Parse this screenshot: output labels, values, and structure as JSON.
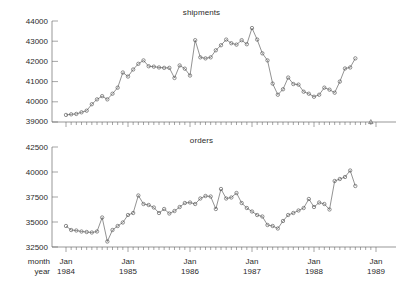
{
  "chart_data": [
    {
      "type": "line",
      "title": "shipments",
      "xlabel": "",
      "ylabel": "",
      "ylim": [
        39000,
        44000
      ],
      "yticks": [
        39000,
        40000,
        41000,
        42000,
        43000,
        44000
      ],
      "ytick_labels": [
        "39000",
        "40000",
        "41000",
        "42000",
        "43000",
        "44000"
      ],
      "xlim": [
        "1984-01",
        "1989-01"
      ],
      "xticks": [
        "1984-01",
        "1985-01",
        "1986-01",
        "1987-01",
        "1988-01",
        "1989-01"
      ],
      "xtick_labels": [
        "Jan 1984",
        "Jan 1985",
        "Jan 1986",
        "Jan 1987",
        "Jan 1988",
        "Jan 1989"
      ],
      "grid": false,
      "legend": "none",
      "marker": "circle",
      "x": [
        "1984-01",
        "1984-02",
        "1984-03",
        "1984-04",
        "1984-05",
        "1984-06",
        "1984-07",
        "1984-08",
        "1984-09",
        "1984-10",
        "1984-11",
        "1984-12",
        "1985-01",
        "1985-02",
        "1985-03",
        "1985-04",
        "1985-05",
        "1985-06",
        "1985-07",
        "1985-08",
        "1985-09",
        "1985-10",
        "1985-11",
        "1985-12",
        "1986-01",
        "1986-02",
        "1986-03",
        "1986-04",
        "1986-05",
        "1986-06",
        "1986-07",
        "1986-08",
        "1986-09",
        "1986-10",
        "1986-11",
        "1986-12",
        "1987-01",
        "1987-02",
        "1987-03",
        "1987-04",
        "1987-05",
        "1987-06",
        "1987-07",
        "1987-08",
        "1987-09",
        "1987-10",
        "1987-11",
        "1987-12",
        "1988-01",
        "1988-02",
        "1988-03",
        "1988-04",
        "1988-05",
        "1988-06",
        "1988-07",
        "1988-08",
        "1988-09"
      ],
      "values": [
        39350,
        39380,
        39400,
        39480,
        39560,
        39880,
        40120,
        40280,
        40120,
        40400,
        40700,
        41450,
        41250,
        41600,
        41880,
        42050,
        41760,
        41740,
        41700,
        41680,
        41680,
        41180,
        41800,
        41640,
        41300,
        43050,
        42200,
        42150,
        42200,
        42550,
        42800,
        43080,
        42900,
        42830,
        43050,
        42850,
        43650,
        43080,
        42400,
        42050,
        40900,
        40350,
        40620,
        41200,
        40880,
        40850,
        40500,
        40400,
        40250,
        40350,
        40700,
        40600,
        40450,
        41000,
        41650,
        41700,
        42150
      ],
      "extra_points": [
        {
          "x": "1988-12",
          "value": 39000,
          "marker": "triangle",
          "note": "lone triangle marker on baseline near Jan 1989"
        }
      ]
    },
    {
      "type": "line",
      "title": "orders",
      "xlabel": "",
      "ylabel": "",
      "ylim": [
        32500,
        42500
      ],
      "yticks": [
        32500,
        35000,
        37500,
        40000,
        42500
      ],
      "ytick_labels": [
        "32500",
        "35000",
        "37500",
        "40000",
        "42500"
      ],
      "xlim": [
        "1984-01",
        "1989-01"
      ],
      "xticks": [
        "1984-01",
        "1985-01",
        "1986-01",
        "1987-01",
        "1988-01",
        "1989-01"
      ],
      "xtick_labels": [
        "Jan 1984",
        "Jan 1985",
        "Jan 1986",
        "Jan 1987",
        "Jan 1988",
        "Jan 1989"
      ],
      "grid": false,
      "legend": "none",
      "marker": "circle",
      "x": [
        "1984-01",
        "1984-02",
        "1984-03",
        "1984-04",
        "1984-05",
        "1984-06",
        "1984-07",
        "1984-08",
        "1984-09",
        "1984-10",
        "1984-11",
        "1984-12",
        "1985-01",
        "1985-02",
        "1985-03",
        "1985-04",
        "1985-05",
        "1985-06",
        "1985-07",
        "1985-08",
        "1985-09",
        "1985-10",
        "1985-11",
        "1985-12",
        "1986-01",
        "1986-02",
        "1986-03",
        "1986-04",
        "1986-05",
        "1986-06",
        "1986-07",
        "1986-08",
        "1986-09",
        "1986-10",
        "1986-11",
        "1986-12",
        "1987-01",
        "1987-02",
        "1987-03",
        "1987-04",
        "1987-05",
        "1987-06",
        "1987-07",
        "1987-08",
        "1987-09",
        "1987-10",
        "1987-11",
        "1987-12",
        "1988-01",
        "1988-02",
        "1988-03",
        "1988-04",
        "1988-05",
        "1988-06",
        "1988-07",
        "1988-08",
        "1988-09"
      ],
      "values": [
        34600,
        34200,
        34150,
        34050,
        34000,
        33950,
        34050,
        35450,
        33050,
        34200,
        34600,
        34950,
        35700,
        35900,
        37650,
        36800,
        36700,
        36450,
        35900,
        36300,
        35850,
        36100,
        36500,
        36900,
        36950,
        36800,
        37350,
        37600,
        37550,
        36300,
        38300,
        37350,
        37450,
        37900,
        36900,
        36400,
        36050,
        35700,
        35550,
        34700,
        34600,
        34350,
        35100,
        35700,
        35900,
        36150,
        36400,
        37300,
        36500,
        36950,
        36800,
        36250,
        39100,
        39300,
        39500,
        40150,
        38600
      ]
    }
  ],
  "axis_row_labels": {
    "month": "month",
    "year": "year"
  }
}
